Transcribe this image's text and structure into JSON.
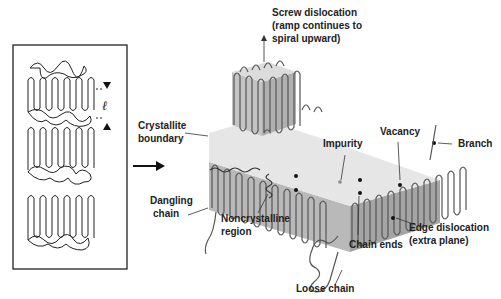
{
  "diagram": {
    "left_panel": {
      "description": "lamellar stacks of folded chains with amorphous tangles",
      "lamella_thickness_symbol": "ℓ"
    },
    "labels": {
      "screw_line1": "Screw dislocation",
      "screw_line2": "(ramp continues to",
      "screw_line3": "spiral upward)",
      "crystallite_line1": "Crystallite",
      "crystallite_line2": "boundary",
      "dangling_line1": "Dangling",
      "dangling_line2": "chain",
      "noncryst_line1": "Noncrystalline",
      "noncryst_line2": "region",
      "impurity": "Impurity",
      "vacancy": "Vacancy",
      "branch": "Branch",
      "chain_ends": "Chain ends",
      "edge_line1": "Edge dislocation",
      "edge_line2": "(extra plane)",
      "loose_chain": "Loose chain"
    },
    "colors": {
      "block_top": "#e6e6e6",
      "block_front": "#b9b9b9",
      "block_side": "#a5a5a5",
      "chain": "#555555",
      "text": "#222222"
    }
  }
}
